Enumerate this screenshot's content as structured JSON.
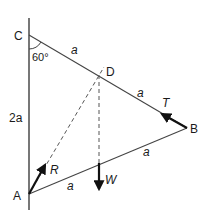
{
  "diagram": {
    "points": {
      "C": {
        "label": "C",
        "x": 29,
        "y": 35
      },
      "A": {
        "label": "A",
        "x": 29,
        "y": 194
      },
      "B": {
        "label": "B",
        "x": 187,
        "y": 128
      },
      "D": {
        "label": "D",
        "x": 100,
        "y": 75
      }
    },
    "wall": {
      "x": 29,
      "y_top": 18,
      "y_bottom": 210
    },
    "angle_label": "60°",
    "length_labels": {
      "CD": "a",
      "DB": "a",
      "BM": "a",
      "MA": "a",
      "CA": "2a"
    },
    "forces": {
      "T": {
        "label": "T"
      },
      "R": {
        "label": "R"
      },
      "W": {
        "label": "W"
      }
    },
    "colors": {
      "line": "#444444",
      "arrow": "#111111",
      "text": "#1a1a1a"
    }
  }
}
